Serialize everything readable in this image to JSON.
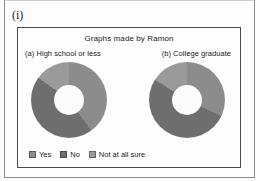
{
  "marker": "(i)",
  "panel": {
    "title": "Graphs made by Ramon",
    "subtitle_a": "(a) High school or less",
    "subtitle_b": "(b) College graduate"
  },
  "legend": {
    "items": [
      {
        "label": "Yes",
        "color": "#8c8c8c"
      },
      {
        "label": "No",
        "color": "#6e6e6e"
      },
      {
        "label": "Not at all sure",
        "color": "#9a9a9a"
      }
    ]
  },
  "chart_data": {
    "type": "pie",
    "title": "Graphs made by Ramon",
    "legend_position": "bottom-left",
    "charts": [
      {
        "name": "(a) High school or less",
        "categories": [
          "Yes",
          "No",
          "Not at all sure"
        ],
        "values": [
          40,
          45,
          15
        ],
        "colors": [
          "#8c8c8c",
          "#6e6e6e",
          "#9a9a9a"
        ]
      },
      {
        "name": "(b) College graduate",
        "categories": [
          "Yes",
          "No",
          "Not at all sure"
        ],
        "values": [
          32,
          52,
          16
        ],
        "colors": [
          "#8c8c8c",
          "#6e6e6e",
          "#9a9a9a"
        ]
      }
    ]
  }
}
